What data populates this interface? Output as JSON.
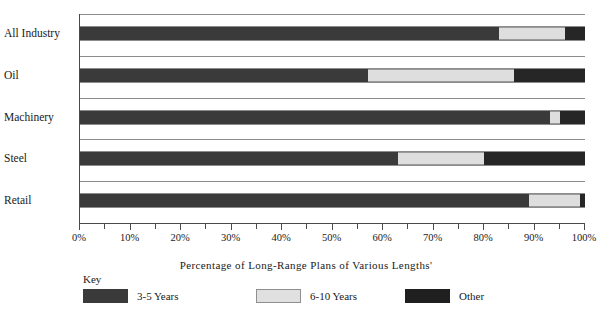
{
  "chart_data": {
    "type": "bar",
    "orientation": "horizontal",
    "stacked": true,
    "title": "",
    "xlabel": "Percentage of Long-Range Plans of Various Lengths'",
    "ylabel": "",
    "xlim": [
      0,
      100
    ],
    "xtick_labels": [
      "0%",
      "10%",
      "20%",
      "30%",
      "40%",
      "50%",
      "60%",
      "70%",
      "80%",
      "90%",
      "100%"
    ],
    "xtick_values": [
      0,
      10,
      20,
      30,
      40,
      50,
      60,
      70,
      80,
      90,
      100
    ],
    "minor_ticks": [
      5,
      15,
      25,
      35,
      45,
      55,
      65,
      75,
      85,
      95
    ],
    "grid": true,
    "legend_position": "bottom",
    "legend_title": "Key",
    "categories": [
      "All Industry",
      "Oil",
      "Machinery",
      "Steel",
      "Retail"
    ],
    "series": [
      {
        "name": "3-5 Years",
        "color": "#3a3a3a",
        "values": [
          83,
          57,
          93,
          63,
          89
        ]
      },
      {
        "name": "6-10 Years",
        "color": "#dedede",
        "values": [
          13,
          29,
          2,
          17,
          10
        ]
      },
      {
        "name": "Other",
        "color": "#262626",
        "values": [
          4,
          14,
          5,
          20,
          1
        ]
      }
    ],
    "rows": [
      {
        "category": "All Industry",
        "segments": [
          {
            "series": "3-5 Years",
            "start": 0,
            "end": 83,
            "value": 83,
            "style": "seg-a"
          },
          {
            "series": "6-10 Years",
            "start": 83,
            "end": 96,
            "value": 13,
            "style": "seg-b"
          },
          {
            "series": "Other",
            "start": 96,
            "end": 100,
            "value": 4,
            "style": "seg-c"
          }
        ]
      },
      {
        "category": "Oil",
        "segments": [
          {
            "series": "3-5 Years",
            "start": 0,
            "end": 57,
            "value": 57,
            "style": "seg-a"
          },
          {
            "series": "6-10 Years",
            "start": 57,
            "end": 86,
            "value": 29,
            "style": "seg-b"
          },
          {
            "series": "Other",
            "start": 86,
            "end": 100,
            "value": 14,
            "style": "seg-c"
          }
        ]
      },
      {
        "category": "Machinery",
        "segments": [
          {
            "series": "3-5 Years",
            "start": 0,
            "end": 93,
            "value": 93,
            "style": "seg-a"
          },
          {
            "series": "6-10 Years",
            "start": 93,
            "end": 95,
            "value": 2,
            "style": "seg-b"
          },
          {
            "series": "Other",
            "start": 95,
            "end": 100,
            "value": 5,
            "style": "seg-c"
          }
        ]
      },
      {
        "category": "Steel",
        "segments": [
          {
            "series": "3-5 Years",
            "start": 0,
            "end": 63,
            "value": 63,
            "style": "seg-a"
          },
          {
            "series": "6-10 Years",
            "start": 63,
            "end": 80,
            "value": 17,
            "style": "seg-b"
          },
          {
            "series": "Other",
            "start": 80,
            "end": 100,
            "value": 20,
            "style": "seg-c"
          }
        ]
      },
      {
        "category": "Retail",
        "segments": [
          {
            "series": "3-5 Years",
            "start": 0,
            "end": 89,
            "value": 89,
            "style": "seg-a"
          },
          {
            "series": "6-10 Years",
            "start": 89,
            "end": 99,
            "value": 10,
            "style": "seg-b"
          },
          {
            "series": "Other",
            "start": 99,
            "end": 100,
            "value": 1,
            "style": "seg-c"
          }
        ]
      }
    ]
  },
  "legend": {
    "title": "Key",
    "entries": [
      {
        "label": "3-5 Years",
        "swatch": "sw-a"
      },
      {
        "label": "6-10 Years",
        "swatch": "sw-b"
      },
      {
        "label": "Other",
        "swatch": "sw-c"
      }
    ]
  },
  "axis": {
    "title": "Percentage of Long-Range Plans of Various Lengths'"
  }
}
